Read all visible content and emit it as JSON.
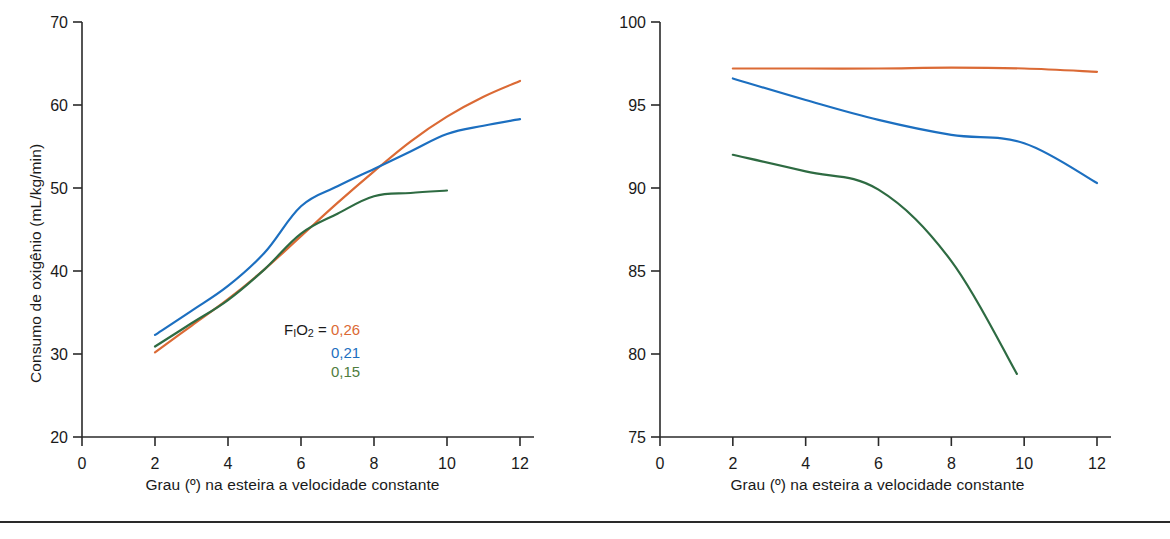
{
  "figure": {
    "divider_visible": true,
    "colors": {
      "series_026": "#DB6A35",
      "series_021": "#1C6FC0",
      "series_015": "#2E6B42",
      "legend_green_text": "#4F7D3E",
      "axis": "#2a2a2a",
      "text": "#1a1a1a"
    }
  },
  "legend": {
    "prefix_f": "F",
    "prefix_f_sub": "I",
    "prefix_o": "O",
    "prefix_o_sub": "2",
    "equals": " = ",
    "entries": [
      {
        "value": "0,26",
        "color": "#DB6A35"
      },
      {
        "value": "0,21",
        "color": "#1C6FC0"
      },
      {
        "value": "0,15",
        "color": "#4F7D3E"
      }
    ]
  },
  "chart_data": [
    {
      "id": "left",
      "type": "line",
      "title": "",
      "xlabel": "Grau (º) na esteira a velocidade constante",
      "ylabel": "Consumo de oxigênio (mL/kg/min)",
      "ylabel_parts": {
        "main": "Consumo de oxigênio (mL/kg/min)"
      },
      "xlim": [
        0,
        12
      ],
      "ylim": [
        20,
        70
      ],
      "xticks": [
        0,
        2,
        4,
        6,
        8,
        10,
        12
      ],
      "yticks": [
        20,
        30,
        40,
        50,
        60,
        70
      ],
      "xticklabels": [
        "0",
        "2",
        "4",
        "6",
        "8",
        "10",
        "12"
      ],
      "yticklabels": [
        "20",
        "30",
        "40",
        "50",
        "60",
        "70"
      ],
      "grid": false,
      "legend_position": "center",
      "series": [
        {
          "name": "0,26",
          "color": "#DB6A35",
          "x": [
            2,
            3,
            4,
            5,
            6,
            7,
            8,
            9,
            10,
            11,
            12
          ],
          "values": [
            30.2,
            33.4,
            36.6,
            40.2,
            44.2,
            48.2,
            52.0,
            55.6,
            58.6,
            61.0,
            62.9
          ]
        },
        {
          "name": "0,21",
          "color": "#1C6FC0",
          "x": [
            2,
            3,
            4,
            5,
            6,
            7,
            8,
            9,
            10,
            11,
            12
          ],
          "values": [
            32.3,
            35.2,
            38.2,
            42.2,
            47.8,
            50.2,
            52.3,
            54.4,
            56.5,
            57.5,
            58.3
          ]
        },
        {
          "name": "0,15",
          "color": "#2E6B42",
          "x": [
            2,
            3,
            4,
            5,
            6,
            7,
            8,
            9,
            10
          ],
          "values": [
            30.9,
            33.7,
            36.5,
            40.2,
            44.5,
            46.9,
            49.0,
            49.4,
            49.7
          ]
        }
      ]
    },
    {
      "id": "right",
      "type": "line",
      "title": "",
      "xlabel": "Grau (º) na esteira a velocidade constante",
      "ylabel": "SaO2 (%)",
      "ylabel_parts": {
        "s": "S",
        "a": "a",
        "o": "O",
        "two": "2",
        "unit": " (%)"
      },
      "xlim": [
        0,
        12
      ],
      "ylim": [
        75,
        100
      ],
      "xticks": [
        0,
        2,
        4,
        6,
        8,
        10,
        12
      ],
      "yticks": [
        75,
        80,
        85,
        90,
        95,
        100
      ],
      "xticklabels": [
        "0",
        "2",
        "4",
        "6",
        "8",
        "10",
        "12"
      ],
      "yticklabels": [
        "75",
        "80",
        "85",
        "90",
        "95",
        "100"
      ],
      "grid": false,
      "legend_position": "center",
      "series": [
        {
          "name": "0,26",
          "color": "#DB6A35",
          "x": [
            2,
            4,
            6,
            8,
            10,
            12
          ],
          "values": [
            97.2,
            97.2,
            97.2,
            97.25,
            97.2,
            97.0
          ]
        },
        {
          "name": "0,21",
          "color": "#1C6FC0",
          "x": [
            2,
            4,
            6,
            8,
            10,
            12
          ],
          "values": [
            96.6,
            95.3,
            94.1,
            93.2,
            92.7,
            90.3
          ]
        },
        {
          "name": "0,15",
          "color": "#2E6B42",
          "x": [
            2,
            4,
            6,
            8,
            9.8
          ],
          "values": [
            92.0,
            91.0,
            89.9,
            85.6,
            78.8
          ]
        }
      ]
    }
  ]
}
